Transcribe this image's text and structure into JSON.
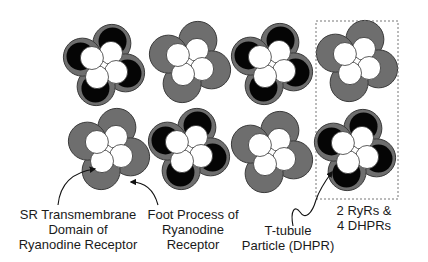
{
  "figure": {
    "colors": {
      "foot_process": "#6e6e6e",
      "foot_outline": "#3a3a3a",
      "dhpr": "#050505",
      "transmembrane": "#ffffff",
      "box": "#777777",
      "text": "#1a1a1a"
    },
    "units": [
      {
        "cx": 104,
        "cy": 65,
        "rot": 20,
        "dhpr": true
      },
      {
        "cx": 190,
        "cy": 62,
        "rot": 20,
        "dhpr": false
      },
      {
        "cx": 272,
        "cy": 64,
        "rot": 20,
        "dhpr": true
      },
      {
        "cx": 357,
        "cy": 61,
        "rot": 20,
        "dhpr": false
      },
      {
        "cx": 109,
        "cy": 149,
        "rot": 20,
        "dhpr": false
      },
      {
        "cx": 189,
        "cy": 149,
        "rot": 20,
        "dhpr": true
      },
      {
        "cx": 272,
        "cy": 152,
        "rot": 20,
        "dhpr": false
      },
      {
        "cx": 355,
        "cy": 150,
        "rot": 20,
        "dhpr": true
      }
    ],
    "highlight_box": {
      "x": 316,
      "y": 21,
      "w": 82,
      "h": 178
    }
  },
  "labels": {
    "sr_transmembrane": {
      "line1": "SR Transmembrane",
      "line2": "Domain of",
      "line3": "Ryanodine Receptor"
    },
    "foot_process": {
      "line1": "Foot Process of",
      "line2": "Ryanodine",
      "line3": "Receptor"
    },
    "t_tubule": {
      "line1": "T-tubule",
      "line2": "Particle (DHPR)"
    },
    "box_caption": {
      "line1": "2 RyRs &",
      "line2": "4 DHPRs"
    }
  }
}
